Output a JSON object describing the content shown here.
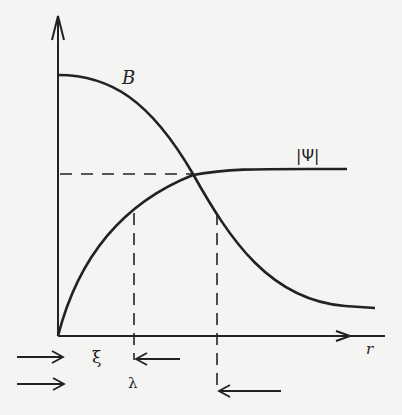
{
  "diagram": {
    "type": "physics-plot",
    "labels": {
      "B": "B",
      "psi": "|Ψ|",
      "r": "r",
      "xi": "ξ",
      "lambda": "λ"
    },
    "curves": [
      {
        "name": "B",
        "description": "decreasing field, starts high at r=0 and decays to low asymptote"
      },
      {
        "name": "|Ψ|",
        "description": "order parameter, starts at 0 and rises to saturation"
      }
    ],
    "markers": [
      {
        "name": "xi",
        "description": "coherence length marked between arrows"
      },
      {
        "name": "lambda",
        "description": "penetration depth marked between arrows"
      }
    ],
    "colors": {
      "ink": "#222222",
      "paper": "#f4f4f2"
    }
  }
}
